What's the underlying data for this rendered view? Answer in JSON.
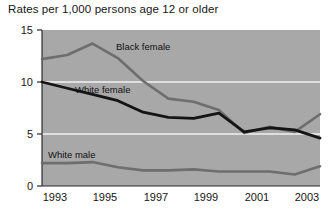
{
  "chart_data": {
    "type": "line",
    "title": "Rates per 1,000 persons age 12 or older",
    "xlabel": "",
    "ylabel": "",
    "xlim": [
      1993,
      2004
    ],
    "ylim": [
      0,
      15
    ],
    "yticks": [
      0,
      5,
      10,
      15
    ],
    "xticks": [
      1993,
      1995,
      1997,
      1999,
      2001,
      2003
    ],
    "ytick_labels": [
      "0",
      "5",
      "10",
      "15"
    ],
    "xtick_labels": [
      "1993",
      "1995",
      "1997",
      "1999",
      "2001",
      "2003"
    ],
    "grid": "horizontal-white-gridlines-at-5-and-10",
    "legend": "inline-labels",
    "plot_background": "#a8a8a8",
    "x": [
      1993,
      1994,
      1995,
      1996,
      1997,
      1998,
      1999,
      2000,
      2001,
      2002,
      2003,
      2004
    ],
    "series": [
      {
        "name": "Black female",
        "color": "#6e6e6e",
        "values": [
          12.2,
          12.6,
          13.7,
          12.3,
          10.1,
          8.4,
          8.1,
          7.3,
          5.1,
          5.7,
          5.2,
          6.9
        ]
      },
      {
        "name": "White female",
        "color": "#141414",
        "values": [
          10.0,
          9.4,
          8.8,
          8.2,
          7.1,
          6.6,
          6.5,
          7.0,
          5.2,
          5.6,
          5.4,
          4.6
        ]
      },
      {
        "name": "White male",
        "color": "#6e6e6e",
        "values": [
          2.2,
          2.2,
          2.3,
          1.8,
          1.5,
          1.5,
          1.6,
          1.4,
          1.4,
          1.4,
          1.1,
          1.9
        ]
      }
    ],
    "annotations": [
      {
        "text": "Black female",
        "x": 1996.0,
        "y": 13.4
      },
      {
        "text": "White female",
        "x": 1994.2,
        "y": 8.6
      },
      {
        "text": "White male",
        "x": 1993.3,
        "y": 3.1
      }
    ]
  }
}
